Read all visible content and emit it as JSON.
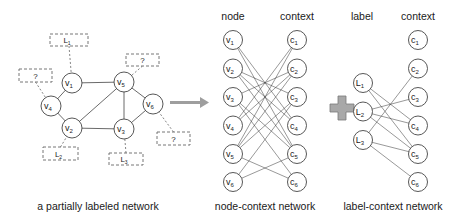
{
  "colors": {
    "stroke": "#444444",
    "arrow": "#9e9e9e",
    "plus_fill": "#a8a8a8",
    "plus_stroke": "#7a7a7a"
  },
  "partial_network": {
    "caption": "a partially labeled network",
    "nodes": [
      {
        "id": "v1",
        "label": "v",
        "sub": "1",
        "x": 72,
        "y": 83
      },
      {
        "id": "v2",
        "label": "v",
        "sub": "2",
        "x": 72,
        "y": 128
      },
      {
        "id": "v3",
        "label": "v",
        "sub": "3",
        "x": 124,
        "y": 129
      },
      {
        "id": "v4",
        "label": "v",
        "sub": "4",
        "x": 51,
        "y": 106
      },
      {
        "id": "v5",
        "label": "v",
        "sub": "5",
        "x": 124,
        "y": 82
      },
      {
        "id": "v6",
        "label": "v",
        "sub": "6",
        "x": 153,
        "y": 104
      }
    ],
    "edges": [
      [
        "v1",
        "v5"
      ],
      [
        "v1",
        "v4"
      ],
      [
        "v4",
        "v2"
      ],
      [
        "v2",
        "v5"
      ],
      [
        "v2",
        "v3"
      ],
      [
        "v5",
        "v3"
      ],
      [
        "v5",
        "v6"
      ],
      [
        "v3",
        "v6"
      ]
    ],
    "labels": [
      {
        "node": "v1",
        "text": "L",
        "sub": "1",
        "x": 50,
        "y": 34,
        "w": 38,
        "h": 12
      },
      {
        "node": "v4",
        "text": "?",
        "sub": "",
        "x": 19,
        "y": 69,
        "w": 33,
        "h": 13
      },
      {
        "node": "v5",
        "text": "?",
        "sub": "",
        "x": 126,
        "y": 54,
        "w": 33,
        "h": 12
      },
      {
        "node": "v6",
        "text": "?",
        "sub": "",
        "x": 157,
        "y": 132,
        "w": 33,
        "h": 13
      },
      {
        "node": "v2",
        "text": "L",
        "sub": "2",
        "x": 43,
        "y": 147,
        "w": 35,
        "h": 13
      },
      {
        "node": "v3",
        "text": "L",
        "sub": "3",
        "x": 109,
        "y": 153,
        "w": 34,
        "h": 12
      }
    ]
  },
  "node_context_network": {
    "caption": "node-context network",
    "left_header": "node",
    "right_header": "context",
    "left": [
      {
        "label": "v",
        "sub": "1"
      },
      {
        "label": "v",
        "sub": "2"
      },
      {
        "label": "v",
        "sub": "3"
      },
      {
        "label": "v",
        "sub": "4"
      },
      {
        "label": "v",
        "sub": "5"
      },
      {
        "label": "v",
        "sub": "6"
      }
    ],
    "right": [
      {
        "label": "c",
        "sub": "1"
      },
      {
        "label": "c",
        "sub": "2"
      },
      {
        "label": "c",
        "sub": "3"
      },
      {
        "label": "c",
        "sub": "4"
      },
      {
        "label": "c",
        "sub": "5"
      },
      {
        "label": "c",
        "sub": "6"
      }
    ],
    "edges": [
      [
        0,
        3
      ],
      [
        0,
        4
      ],
      [
        1,
        2
      ],
      [
        1,
        3
      ],
      [
        1,
        4
      ],
      [
        2,
        1
      ],
      [
        2,
        4
      ],
      [
        2,
        5
      ],
      [
        3,
        0
      ],
      [
        3,
        1
      ],
      [
        4,
        0
      ],
      [
        4,
        1
      ],
      [
        4,
        2
      ],
      [
        4,
        5
      ],
      [
        5,
        2
      ],
      [
        5,
        4
      ]
    ]
  },
  "label_context_network": {
    "caption": "label-context network",
    "left_header": "label",
    "right_header": "context",
    "left": [
      {
        "label": "L",
        "sub": "1"
      },
      {
        "label": "L",
        "sub": "2"
      },
      {
        "label": "L",
        "sub": "3"
      }
    ],
    "right": [
      {
        "label": "c",
        "sub": "1"
      },
      {
        "label": "c",
        "sub": "2"
      },
      {
        "label": "c",
        "sub": "3"
      },
      {
        "label": "c",
        "sub": "4"
      },
      {
        "label": "c",
        "sub": "5"
      },
      {
        "label": "c",
        "sub": "6"
      }
    ],
    "edges": [
      [
        0,
        3
      ],
      [
        0,
        4
      ],
      [
        1,
        2
      ],
      [
        1,
        3
      ],
      [
        1,
        4
      ],
      [
        2,
        1
      ],
      [
        2,
        4
      ],
      [
        2,
        5
      ]
    ]
  }
}
